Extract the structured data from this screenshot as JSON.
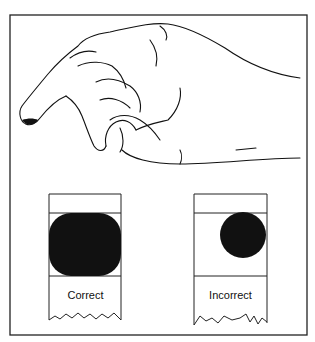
{
  "figure": {
    "illustration": "hand-pressing-finger",
    "samples": [
      {
        "label": "Correct",
        "spot": "large-filled-spot"
      },
      {
        "label": "Incorrect",
        "spot": "small-spot"
      }
    ]
  }
}
